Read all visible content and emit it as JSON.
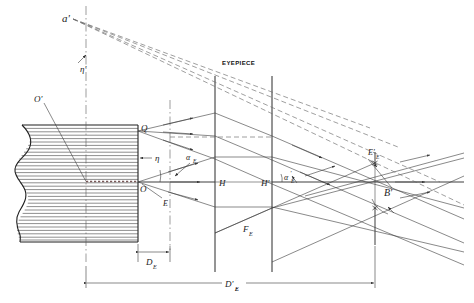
{
  "figure": {
    "title": "EYEPIECE",
    "type": "optical-ray-diagram",
    "background_color": "#ffffff",
    "line_color": "#2b2b2b",
    "dashed_color": "#6a6a6a"
  },
  "labels": {
    "eyepiece": "EYEPIECE",
    "virtual_image_point": "a'",
    "virtual_image_height": "η'",
    "object_center_prime": "O'",
    "object_top": "Q",
    "object_height": "η",
    "object_axis_point": "O",
    "entrance_pupil": "E",
    "field_angle": "α",
    "field_angle_sub": "E",
    "field_angle_prime": "α",
    "field_angle_prime_sub": "E",
    "principal_plane_first": "H",
    "principal_plane_second": "H'",
    "focal_length": "F",
    "focal_length_sub": "E",
    "exit_pupil": "E'",
    "exit_pupil_sub": "E",
    "exit_angle": "B'",
    "dim_near": "D",
    "dim_near_sub": "E",
    "dim_far": "D'",
    "dim_far_sub": "E"
  },
  "geometry": {
    "object_plane_x": 138,
    "entrance_pupil_x": 170,
    "eyepiece_h_x": 215,
    "eyepiece_hp_x": 272,
    "exit_pupil_x": 375,
    "optical_axis_y": 182,
    "object_top_y": 131,
    "virtual_point": {
      "x": 71,
      "y": 18
    },
    "block_left_x": 18,
    "block_right_x": 138,
    "block_top_y": 125,
    "block_bottom_y": 242,
    "vertical_centerline_x": 86
  },
  "annotations": [
    {
      "name": "virtual-image-point",
      "text": "a'"
    },
    {
      "name": "virtual-image-height",
      "text": "η'"
    },
    {
      "name": "object-center-prime",
      "text": "O'"
    },
    {
      "name": "object-top-point",
      "text": "Q"
    },
    {
      "name": "object-height",
      "text": "η"
    },
    {
      "name": "object-axis-point",
      "text": "O"
    },
    {
      "name": "entrance-pupil-point",
      "text": "E"
    },
    {
      "name": "eyepiece-title",
      "text": "EYEPIECE"
    },
    {
      "name": "principal-plane-h",
      "text": "H"
    },
    {
      "name": "principal-plane-h-prime",
      "text": "H'"
    },
    {
      "name": "focal-length",
      "text": "Fₑ"
    },
    {
      "name": "exit-pupil",
      "text": "E'ₑ"
    },
    {
      "name": "exit-angle",
      "text": "B'"
    },
    {
      "name": "dimension-near",
      "text": "Dₑ"
    },
    {
      "name": "dimension-far",
      "text": "D'ₑ"
    }
  ]
}
